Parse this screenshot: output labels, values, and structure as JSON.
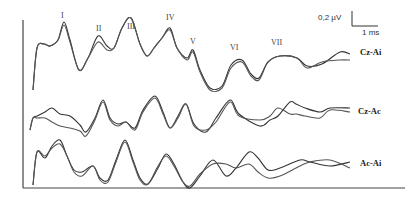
{
  "chart_data": {
    "type": "line",
    "title": "",
    "xlabel": "",
    "ylabel": "",
    "grid": false,
    "scale_bar": {
      "amplitude": "0,2 µV",
      "time": "1 ms"
    },
    "peak_labels": [
      "I",
      "II",
      "III",
      "IV",
      "V",
      "VI",
      "VII"
    ],
    "channels": [
      {
        "name": "Cz-Ai",
        "series": [
          {
            "name": "trace-1",
            "points": [
              [
                33,
                90
              ],
              [
                37,
                48
              ],
              [
                44,
                44
              ],
              [
                50,
                46
              ],
              [
                58,
                40
              ],
              [
                64,
                22
              ],
              [
                70,
                40
              ],
              [
                79,
                70
              ],
              [
                88,
                58
              ],
              [
                98,
                36
              ],
              [
                107,
                46
              ],
              [
                114,
                48
              ],
              [
                122,
                28
              ],
              [
                131,
                18
              ],
              [
                140,
                44
              ],
              [
                147,
                56
              ],
              [
                154,
                48
              ],
              [
                162,
                38
              ],
              [
                170,
                28
              ],
              [
                177,
                48
              ],
              [
                187,
                58
              ],
              [
                193,
                50
              ],
              [
                200,
                70
              ],
              [
                210,
                88
              ],
              [
                222,
                86
              ],
              [
                231,
                65
              ],
              [
                242,
                60
              ],
              [
                251,
                74
              ],
              [
                259,
                78
              ],
              [
                268,
                62
              ],
              [
                280,
                56
              ],
              [
                297,
                58
              ],
              [
                307,
                66
              ],
              [
                322,
                64
              ],
              [
                340,
                52
              ],
              [
                350,
                54
              ]
            ]
          },
          {
            "name": "trace-2",
            "points": [
              [
                33,
                90
              ],
              [
                37,
                48
              ],
              [
                44,
                44
              ],
              [
                50,
                46
              ],
              [
                58,
                40
              ],
              [
                64,
                25
              ],
              [
                70,
                42
              ],
              [
                79,
                70
              ],
              [
                88,
                58
              ],
              [
                98,
                42
              ],
              [
                107,
                50
              ],
              [
                114,
                48
              ],
              [
                122,
                28
              ],
              [
                131,
                18
              ],
              [
                140,
                44
              ],
              [
                147,
                56
              ],
              [
                154,
                48
              ],
              [
                162,
                38
              ],
              [
                170,
                30
              ],
              [
                177,
                48
              ],
              [
                187,
                60
              ],
              [
                193,
                52
              ],
              [
                200,
                72
              ],
              [
                210,
                90
              ],
              [
                222,
                88
              ],
              [
                231,
                68
              ],
              [
                242,
                62
              ],
              [
                251,
                76
              ],
              [
                259,
                80
              ],
              [
                268,
                62
              ],
              [
                280,
                56
              ],
              [
                297,
                58
              ],
              [
                307,
                68
              ],
              [
                322,
                62
              ],
              [
                340,
                60
              ],
              [
                350,
                60
              ]
            ]
          }
        ]
      },
      {
        "name": "Cz-Ac",
        "series": [
          {
            "name": "trace-1",
            "points": [
              [
                30,
                130
              ],
              [
                33,
                118
              ],
              [
                37,
                116
              ],
              [
                45,
                112
              ],
              [
                52,
                108
              ],
              [
                60,
                114
              ],
              [
                70,
                116
              ],
              [
                80,
                125
              ],
              [
                86,
                132
              ],
              [
                95,
                118
              ],
              [
                103,
                100
              ],
              [
                110,
                118
              ],
              [
                118,
                124
              ],
              [
                126,
                122
              ],
              [
                135,
                128
              ],
              [
                143,
                110
              ],
              [
                155,
                96
              ],
              [
                163,
                112
              ],
              [
                170,
                128
              ],
              [
                178,
                116
              ],
              [
                186,
                104
              ],
              [
                194,
                124
              ],
              [
                206,
                132
              ],
              [
                216,
                118
              ],
              [
                230,
                100
              ],
              [
                239,
                114
              ],
              [
                260,
                126
              ],
              [
                270,
                120
              ],
              [
                278,
                116
              ],
              [
                290,
                102
              ],
              [
                296,
                104
              ],
              [
                305,
                108
              ],
              [
                320,
                112
              ],
              [
                330,
                108
              ],
              [
                350,
                108
              ]
            ]
          },
          {
            "name": "trace-2",
            "points": [
              [
                30,
                130
              ],
              [
                33,
                118
              ],
              [
                37,
                118
              ],
              [
                45,
                118
              ],
              [
                52,
                122
              ],
              [
                60,
                126
              ],
              [
                70,
                128
              ],
              [
                80,
                131
              ],
              [
                86,
                136
              ],
              [
                95,
                120
              ],
              [
                103,
                102
              ],
              [
                110,
                120
              ],
              [
                118,
                126
              ],
              [
                126,
                122
              ],
              [
                135,
                130
              ],
              [
                143,
                112
              ],
              [
                155,
                98
              ],
              [
                163,
                114
              ],
              [
                170,
                128
              ],
              [
                178,
                118
              ],
              [
                186,
                104
              ],
              [
                194,
                126
              ],
              [
                206,
                130
              ],
              [
                216,
                122
              ],
              [
                230,
                102
              ],
              [
                239,
                116
              ],
              [
                260,
                120
              ],
              [
                270,
                116
              ],
              [
                278,
                108
              ],
              [
                290,
                114
              ],
              [
                296,
                114
              ],
              [
                305,
                116
              ],
              [
                320,
                118
              ],
              [
                330,
                110
              ],
              [
                350,
                112
              ]
            ]
          }
        ]
      },
      {
        "name": "Ac-Ai",
        "series": [
          {
            "name": "trace-1",
            "points": [
              [
                33,
                185
              ],
              [
                37,
                152
              ],
              [
                45,
                158
              ],
              [
                52,
                146
              ],
              [
                60,
                140
              ],
              [
                67,
                156
              ],
              [
                74,
                170
              ],
              [
                82,
                172
              ],
              [
                93,
                166
              ],
              [
                100,
                178
              ],
              [
                108,
                180
              ],
              [
                116,
                160
              ],
              [
                125,
                140
              ],
              [
                133,
                160
              ],
              [
                140,
                178
              ],
              [
                148,
                184
              ],
              [
                158,
                168
              ],
              [
                166,
                154
              ],
              [
                174,
                164
              ],
              [
                183,
                182
              ],
              [
                190,
                188
              ],
              [
                200,
                176
              ],
              [
                213,
                160
              ],
              [
                226,
                176
              ],
              [
                236,
                168
              ],
              [
                249,
                152
              ],
              [
                258,
                158
              ],
              [
                268,
                170
              ],
              [
                280,
                168
              ],
              [
                300,
                160
              ],
              [
                310,
                162
              ],
              [
                330,
                166
              ],
              [
                350,
                162
              ]
            ]
          },
          {
            "name": "trace-2",
            "points": [
              [
                33,
                185
              ],
              [
                37,
                152
              ],
              [
                45,
                156
              ],
              [
                52,
                148
              ],
              [
                60,
                144
              ],
              [
                67,
                156
              ],
              [
                74,
                172
              ],
              [
                82,
                176
              ],
              [
                93,
                166
              ],
              [
                100,
                180
              ],
              [
                108,
                182
              ],
              [
                116,
                162
              ],
              [
                125,
                142
              ],
              [
                133,
                162
              ],
              [
                140,
                180
              ],
              [
                148,
                184
              ],
              [
                158,
                166
              ],
              [
                166,
                156
              ],
              [
                174,
                166
              ],
              [
                183,
                182
              ],
              [
                190,
                186
              ],
              [
                200,
                174
              ],
              [
                213,
                164
              ],
              [
                226,
                164
              ],
              [
                236,
                168
              ],
              [
                249,
                164
              ],
              [
                258,
                172
              ],
              [
                268,
                178
              ],
              [
                280,
                176
              ],
              [
                300,
                166
              ],
              [
                310,
                162
              ],
              [
                330,
                160
              ],
              [
                350,
                168
              ]
            ]
          }
        ]
      }
    ]
  }
}
